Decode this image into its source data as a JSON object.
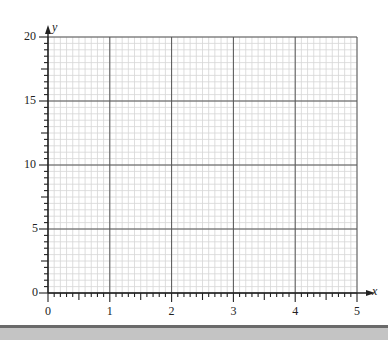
{
  "chart_data": {
    "type": "scatter",
    "title": "",
    "xlabel": "x",
    "ylabel": "y",
    "xlim": [
      0,
      5
    ],
    "ylim": [
      0,
      20
    ],
    "x_ticks": [
      "0",
      "1",
      "2",
      "3",
      "4",
      "5"
    ],
    "y_ticks": [
      "0",
      "5",
      "10",
      "15",
      "20"
    ],
    "grid": {
      "on": true,
      "major_x_step": 1,
      "major_y_step": 5,
      "minor_x_step": 0.1,
      "minor_y_step": 0.5
    },
    "series": [],
    "legend": null
  },
  "colors": {
    "minor_grid": "#d6d6d6",
    "major_grid": "#555555",
    "axis": "#222222",
    "bottom_bar": "#c4c4c4"
  }
}
